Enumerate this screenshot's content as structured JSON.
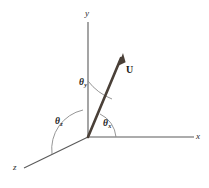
{
  "figure": {
    "background_color": "#ffffff",
    "axis_color": "#5a5a5a",
    "vector_color": "#4a4038",
    "arc_color": "#7a7a7a",
    "label_color": "#2b2b2b"
  },
  "axes": [
    {
      "name": "y-axis",
      "label": "y",
      "label_x": 85,
      "label_y": 9
    },
    {
      "name": "x-axis",
      "label": "x",
      "label_x": 196,
      "label_y": 132
    },
    {
      "name": "z-axis",
      "label": "z",
      "label_x": 13,
      "label_y": 163
    }
  ],
  "vector": {
    "label": "U",
    "label_x": 126,
    "label_y": 65
  },
  "angles": [
    {
      "name": "theta-y",
      "symbol": "θ",
      "subscript": "y",
      "label_x": 79,
      "label_y": 78
    },
    {
      "name": "theta-z",
      "symbol": "θ",
      "subscript": "z",
      "label_x": 55,
      "label_y": 117
    },
    {
      "name": "theta-x",
      "symbol": "θ",
      "subscript": "x",
      "label_x": 103,
      "label_y": 119
    }
  ]
}
